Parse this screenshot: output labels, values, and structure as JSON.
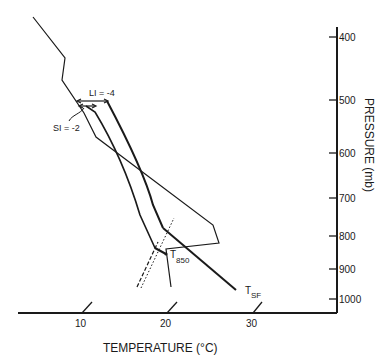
{
  "diagram": {
    "type": "thermodynamic sounding diagram (skew-T style)",
    "x_axis": {
      "title": "TEMPERATURE (°C)",
      "ticks": [
        "10",
        "20",
        "30"
      ]
    },
    "y_axis": {
      "title": "PRESSURE (mb)",
      "ticks": [
        "400",
        "500",
        "600",
        "700",
        "800",
        "900",
        "1000"
      ]
    },
    "annotations": {
      "lifted_index": "LI = -4",
      "showalter_index": "SI = -2",
      "t850_label": "T",
      "t850_sub": "850",
      "tsf_label": "T",
      "tsf_sub": "SF"
    },
    "colors": {
      "line": "#1a1a1a",
      "background": "#ffffff"
    }
  }
}
